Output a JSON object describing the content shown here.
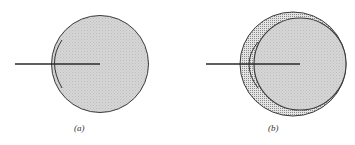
{
  "figure": {
    "panels": [
      {
        "id": "a",
        "caption": "(a)"
      },
      {
        "id": "b",
        "caption": "(b)"
      }
    ]
  },
  "colors": {
    "sphere_fill": "#d2d2d2",
    "shell_fill": "#b8b8b8",
    "stroke": "#333333"
  }
}
